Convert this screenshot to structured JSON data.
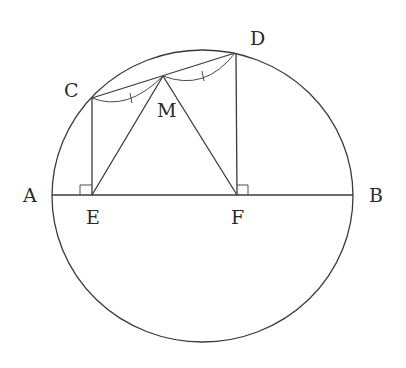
{
  "diagram": {
    "type": "geometry",
    "points": {
      "A": {
        "label": "A",
        "x": 52,
        "y": 195
      },
      "B": {
        "label": "B",
        "x": 353,
        "y": 195
      },
      "C": {
        "label": "C",
        "x": 92,
        "y": 98
      },
      "D": {
        "label": "D",
        "x": 235,
        "y": 53
      },
      "M": {
        "label": "M",
        "x": 163,
        "y": 76
      },
      "E": {
        "label": "E",
        "x": 92,
        "y": 195
      },
      "F": {
        "label": "F",
        "x": 237,
        "y": 195
      }
    },
    "labels": {
      "A": "A",
      "B": "B",
      "C": "C",
      "D": "D",
      "M": "M",
      "E": "E",
      "F": "F"
    },
    "segments": [
      "AB",
      "CD",
      "CE",
      "DF",
      "ME",
      "MF"
    ],
    "marks": {
      "right_angles": [
        "E",
        "F"
      ],
      "equal_arcs": [
        "CM",
        "MD"
      ]
    },
    "colors": {
      "stroke": "#3a3a3a",
      "text": "#2a2a2a",
      "background": "#ffffff"
    }
  }
}
